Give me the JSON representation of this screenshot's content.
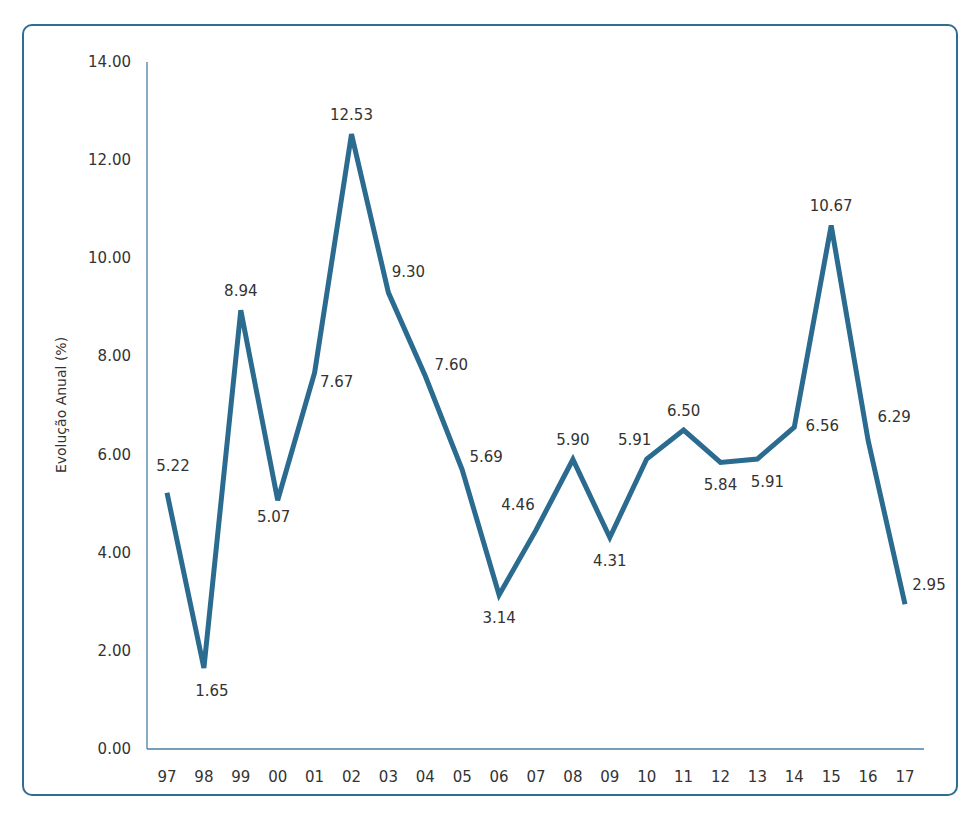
{
  "chart_data": {
    "type": "line",
    "title": "",
    "xlabel": "",
    "ylabel": "Evolução Anual (%)",
    "ylim": [
      0,
      14
    ],
    "yticks": [
      "0.00",
      "2.00",
      "4.00",
      "6.00",
      "8.00",
      "10.00",
      "12.00",
      "14.00"
    ],
    "categories": [
      "97",
      "98",
      "99",
      "00",
      "01",
      "02",
      "03",
      "04",
      "05",
      "06",
      "07",
      "08",
      "09",
      "10",
      "11",
      "12",
      "13",
      "14",
      "15",
      "16",
      "17"
    ],
    "series": [
      {
        "name": "Evolução Anual (%)",
        "values": [
          5.22,
          1.65,
          8.94,
          5.07,
          7.67,
          12.53,
          9.3,
          7.6,
          5.69,
          3.14,
          4.46,
          5.9,
          4.31,
          5.91,
          6.5,
          5.84,
          5.91,
          6.56,
          10.67,
          6.29,
          2.95
        ],
        "labels": [
          "5.22",
          "1.65",
          "8.94",
          "5.07",
          "7.67",
          "12.53",
          "9.30",
          "7.60",
          "5.69",
          "3.14",
          "4.46",
          "5.90",
          "4.31",
          "5.91",
          "6.50",
          "5.84",
          "5.91",
          "6.56",
          "10.67",
          "6.29",
          "2.95"
        ],
        "color": "#2a6b8f"
      }
    ],
    "grid": false,
    "legend": "none"
  },
  "colors": {
    "line": "#2a6b8f",
    "border": "#2f6d92",
    "axis": "#4a7fa3",
    "text": "#333333"
  }
}
